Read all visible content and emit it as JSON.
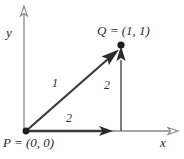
{
  "figure": {
    "background_color": "#ffffff",
    "ink_color": "#2b2b2b",
    "axes": {
      "x_label": "x",
      "y_label": "y"
    },
    "points": [
      {
        "name": "P",
        "label": "P = (0, 0)",
        "x": 0,
        "y": 0
      },
      {
        "name": "Q",
        "label": "Q = (1, 1)",
        "x": 1,
        "y": 1
      }
    ],
    "edges": [
      {
        "name": "diagonal",
        "label": "1",
        "from": "P",
        "to": "Q"
      },
      {
        "name": "horizontal",
        "label": "2",
        "from": "P",
        "to": "foot"
      },
      {
        "name": "vertical",
        "label": "2",
        "from": "foot",
        "to": "Q"
      }
    ]
  }
}
